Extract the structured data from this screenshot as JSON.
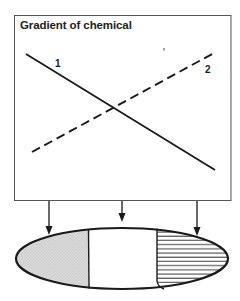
{
  "diagram": {
    "title": "Gradient of chemical",
    "lines": [
      {
        "label": "1",
        "style": "solid",
        "from": [
          26,
          54
        ],
        "to": [
          215,
          170
        ]
      },
      {
        "label": "2",
        "style": "dashed",
        "from": [
          32,
          152
        ],
        "to": [
          214,
          53
        ]
      }
    ],
    "arrows": [
      {
        "x": 49,
        "from_y": 201,
        "to_y": 236
      },
      {
        "x": 122,
        "from_y": 201,
        "to_y": 222
      },
      {
        "x": 197,
        "from_y": 201,
        "to_y": 236
      }
    ],
    "embryo": {
      "regions": [
        {
          "name": "anterior",
          "fill": "stippled-gray"
        },
        {
          "name": "middle",
          "fill": "white"
        },
        {
          "name": "posterior",
          "fill": "horizontal-stripes"
        }
      ]
    },
    "colors": {
      "stroke": "#1a1a1a",
      "gray_fill": "#d6d6d6",
      "frame": "#555555"
    }
  }
}
